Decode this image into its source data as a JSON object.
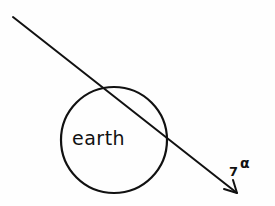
{
  "diagram": {
    "earth_label": "earth",
    "particle_label": "7",
    "particle_superscript": "α",
    "colors": {
      "stroke": "#111111",
      "background": "#fefefe"
    },
    "earth_circle": {
      "cx": 114,
      "cy": 140,
      "r": 53
    },
    "trajectory": {
      "x1": 13,
      "y1": 17,
      "x2": 237,
      "y2": 193,
      "arrowhead": "end"
    }
  }
}
